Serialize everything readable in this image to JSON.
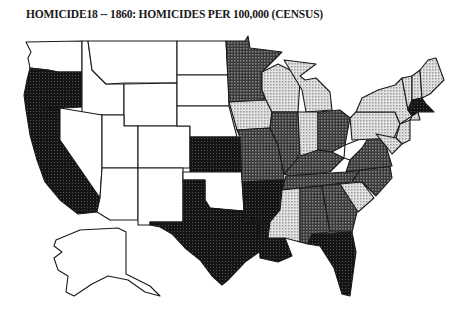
{
  "title": "HOMICIDE18 -- 1860: HOMICIDES PER 100,000 (CENSUS)",
  "map": {
    "type": "choropleth",
    "region": "United States (incl. Alaska inset)",
    "shade_levels": {
      "none": "#ffffff",
      "light": "#c8c8c8",
      "medium": "#8a8a8a",
      "dark": "#4a4a4a",
      "darkest": "#1e1e1e"
    },
    "states": {
      "WA": "none",
      "OR": "darkest",
      "CA": "darkest",
      "ID": "none",
      "NV": "none",
      "MT": "none",
      "WY": "none",
      "UT": "none",
      "AZ": "none",
      "CO": "none",
      "NM": "none",
      "ND": "none",
      "SD": "none",
      "NE": "none",
      "KS": "darkest",
      "OK": "none",
      "TX": "darkest",
      "MN": "dark",
      "IA": "light",
      "MO": "dark",
      "AR": "darkest",
      "LA": "darkest",
      "WI": "light",
      "IL": "dark",
      "MI": "light",
      "IN": "light",
      "OH": "dark",
      "KY": "dark",
      "TN": "dark",
      "MS": "light",
      "AL": "dark",
      "GA": "dark",
      "FL": "darkest",
      "SC": "light",
      "NC": "dark",
      "VA": "dark",
      "WV": "none",
      "PA": "light",
      "NY": "light",
      "NJ": "light",
      "DE": "light",
      "MD": "light",
      "VT": "light",
      "NH": "light",
      "ME": "light",
      "MA": "darkest",
      "CT": "light",
      "RI": "light",
      "AK": "none"
    }
  }
}
